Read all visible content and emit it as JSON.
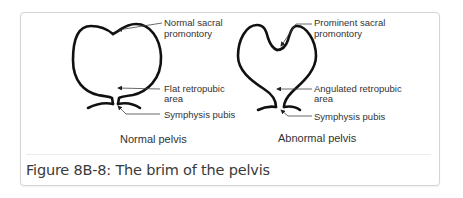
{
  "figure": {
    "caption": "Figure 8B-8: The brim of the pelvis",
    "panels": [
      {
        "title": "Normal pelvis",
        "labels": {
          "sacral_line1": "Normal sacral",
          "sacral_line2": "promontory",
          "retro_line1": "Flat retropubic",
          "retro_line2": "area",
          "symphysis": "Symphysis pubis"
        }
      },
      {
        "title": "Abnormal pelvis",
        "labels": {
          "sacral_line1": "Prominent sacral",
          "sacral_line2": "promontory",
          "retro_line1": "Angulated retropubic",
          "retro_line2": "area",
          "symphysis": "Symphysis pubis"
        }
      }
    ]
  }
}
